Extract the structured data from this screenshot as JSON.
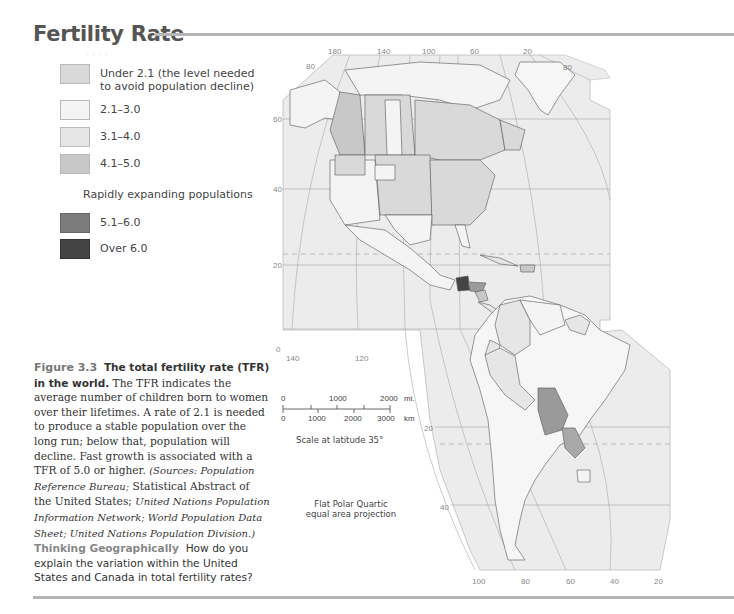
{
  "title": "Fertility Rate",
  "legend": {
    "items": [
      {
        "label_line1": "Under 2.1 (the level needed",
        "label_line2": "to avoid population decline)",
        "color": "#d9d9d9"
      },
      {
        "label_line1": "2.1–3.0",
        "color": "#f4f4f4"
      },
      {
        "label_line1": "3.1–4.0",
        "color": "#e6e6e6"
      },
      {
        "label_line1": "4.1–5.0",
        "color": "#c8c8c8"
      }
    ],
    "subheading": "Rapidly expanding populations",
    "high_items": [
      {
        "label_line1": "5.1–6.0",
        "color": "#7c7c7c"
      },
      {
        "label_line1": "Over 6.0",
        "color": "#444444"
      }
    ]
  },
  "caption": {
    "figure_label": "Figure 3.3",
    "heading": "The total fertility rate (TFR) in the world.",
    "body": "The TFR indicates the average number of children born to women over their lifetimes. A rate of 2.1 is needed to produce a stable population over the long run; below that, population will decline. Fast growth is associated with a TFR of 5.0 or higher.",
    "sources_open": "(Sources: Population Reference Bureau;",
    "sources_mid1": "Statistical Abstract of the United States;",
    "sources_mid2": "United Nations Population Information Network; World Population Data Sheet; United Nations Population Division.)",
    "thinking_label": "Thinking Geographically",
    "question": "How do you explain the variation within the United States and Canada in total fertility rates?"
  },
  "scale": {
    "miles_ticks": [
      "0",
      "1000",
      "2000"
    ],
    "miles_unit": "mi.",
    "km_ticks": [
      "0",
      "1000",
      "2000",
      "3000"
    ],
    "km_unit": "km",
    "note": "Scale at latitude 35°"
  },
  "projection": {
    "line1": "Flat Polar Quartic",
    "line2": "equal area projection"
  },
  "map": {
    "top_longitudes": [
      "180",
      "140",
      "100",
      "60",
      "20"
    ],
    "bottom_longitudes": [
      "100",
      "80",
      "60",
      "40",
      "20"
    ],
    "left_longitudes": [
      "140",
      "120"
    ],
    "latitudes_north": [
      "80",
      "60",
      "40",
      "20",
      "0"
    ],
    "latitude_north_right": "80",
    "latitudes_south": [
      "20",
      "40"
    ],
    "colors": {
      "ocean": "#ececec",
      "grid": "#a9a9a9",
      "border": "#555555",
      "tropic": "#b0b0b0"
    }
  }
}
